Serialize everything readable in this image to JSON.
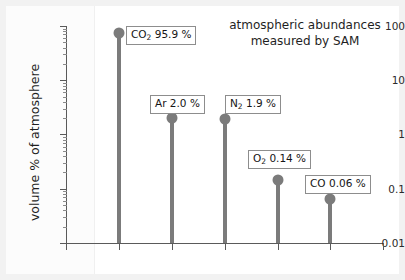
{
  "chart_data": {
    "type": "scatter",
    "title": "atmospheric abundances measured by SAM",
    "title_line1": "atmospheric abundances",
    "title_line2": "measured by SAM",
    "xlabel": "",
    "ylabel": "volume % of atmosphere",
    "yscale": "log",
    "ylim": [
      0.01,
      100
    ],
    "y_tick_labels": [
      "100",
      "10",
      "1",
      "0.1",
      "0.01"
    ],
    "y_tick_values": [
      100,
      10,
      1,
      0.1,
      0.01
    ],
    "x_tick_labels": [
      "",
      "",
      "",
      "",
      "",
      "",
      ""
    ],
    "grid": false,
    "legend": "none",
    "series_name": "SAM measurement",
    "categories": [
      "CO2",
      "Ar",
      "N2",
      "O2",
      "CO"
    ],
    "values": [
      95.9,
      2.0,
      1.9,
      0.14,
      0.06
    ],
    "points": [
      {
        "species": "CO2",
        "species_main": "CO",
        "species_sub": "2",
        "value": 95.9,
        "unit": "%",
        "label": "CO2 95.9 %",
        "label_value_text": "95.9 %"
      },
      {
        "species": "Ar",
        "species_main": "Ar",
        "species_sub": "",
        "value": 2.0,
        "unit": "%",
        "label": "Ar 2.0 %",
        "label_value_text": "2.0 %"
      },
      {
        "species": "N2",
        "species_main": "N",
        "species_sub": "2",
        "value": 1.9,
        "unit": "%",
        "label": "N2 1.9 %",
        "label_value_text": "1.9 %"
      },
      {
        "species": "O2",
        "species_main": "O",
        "species_sub": "2",
        "value": 0.14,
        "unit": "%",
        "label": "O2 0.14 %",
        "label_value_text": "0.14 %"
      },
      {
        "species": "CO",
        "species_main": "CO",
        "species_sub": "",
        "value": 0.06,
        "unit": "%",
        "label": "CO 0.06 %",
        "label_value_text": "0.06 %"
      }
    ],
    "colors": {
      "marker": "#7b7b7b",
      "stem": "#7b7b7b",
      "axis": "#5a5a5a",
      "text": "#1f1f1f",
      "label_border": "#8d8d8d",
      "background": "#ffffff"
    }
  }
}
